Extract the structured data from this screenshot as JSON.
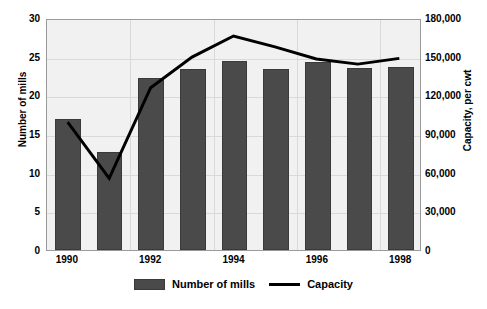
{
  "chart_data": {
    "type": "bar",
    "title": "",
    "xlabel": "",
    "ylabel": "Number of mills",
    "y2label": "Capacity, per cwt",
    "grid": true,
    "legend_position": "bottom",
    "categories": [
      "1990",
      "1991",
      "1992",
      "1993",
      "1994",
      "1995",
      "1996",
      "1997",
      "1998"
    ],
    "x_tick_labels": [
      "1990",
      "",
      "1992",
      "",
      "1994",
      "",
      "1996",
      "",
      "1998"
    ],
    "ylim": [
      0,
      30
    ],
    "y_ticks": [
      "0",
      "5",
      "10",
      "15",
      "20",
      "25",
      "30"
    ],
    "y2lim": [
      0,
      180000
    ],
    "y2_ticks": [
      "0",
      "30,000",
      "60,000",
      "90,000",
      "120,000",
      "150,000",
      "180,000"
    ],
    "series": [
      {
        "name": "Number of mills",
        "type": "bar",
        "axis": "left",
        "color": "#4a4a4a",
        "values": [
          17.0,
          12.7,
          22.2,
          23.4,
          24.4,
          23.4,
          24.3,
          23.6,
          23.7
        ]
      },
      {
        "name": "Capacity",
        "type": "line",
        "axis": "right",
        "color": "#000000",
        "values": [
          100000,
          56000,
          127000,
          151000,
          167500,
          159000,
          149500,
          145500,
          150000
        ]
      }
    ]
  },
  "legend": {
    "items": [
      {
        "label": "Number of mills",
        "marker": "bar-swatch"
      },
      {
        "label": "Capacity",
        "marker": "line-swatch"
      }
    ]
  }
}
